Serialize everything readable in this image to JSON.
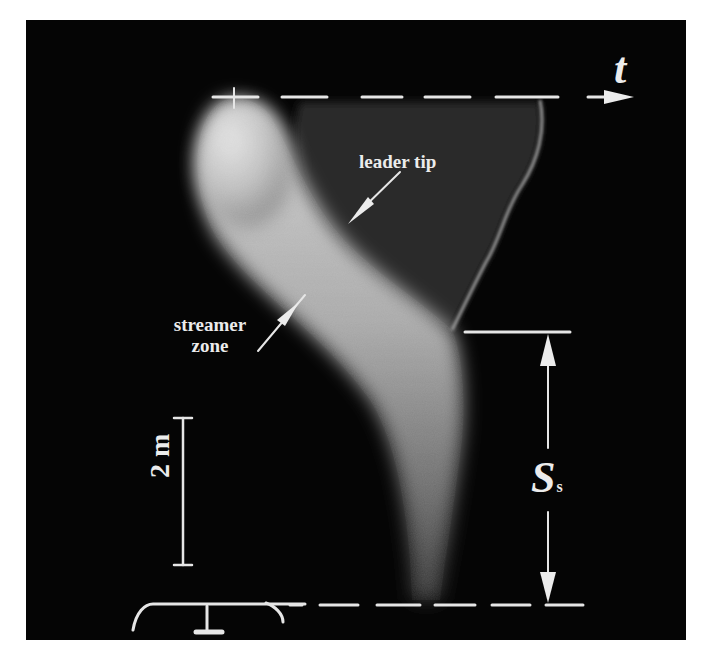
{
  "figure": {
    "type": "streak-camera photograph of leader-streamer discharge",
    "background_color": "#050505",
    "annotation_color": "#ececec",
    "labels": {
      "time_axis": "t",
      "leader_tip": "leader tip",
      "streamer_zone_line1": "streamer",
      "streamer_zone_line2": "zone",
      "scale_bar": "2 m",
      "streamer_length_symbol": "S",
      "streamer_length_subscript": "s"
    },
    "elements": {
      "top_dashed_axis": {
        "y": 97,
        "x_start": 213,
        "x_end": 630,
        "arrow": "right"
      },
      "bottom_dashed_line": {
        "y": 605,
        "x_start": 290,
        "x_end": 583
      },
      "scale_bar": {
        "x": 183,
        "y_top": 418,
        "y_bottom": 565,
        "length_label": "2 m"
      },
      "ss_dimension": {
        "x": 548,
        "y_top": 332,
        "y_bottom": 605
      },
      "electrode": "rod-plane electrode sketch at bottom left"
    }
  }
}
